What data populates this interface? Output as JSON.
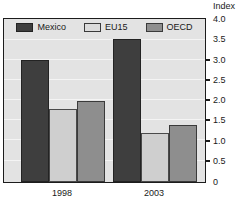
{
  "chart_data": {
    "type": "bar",
    "title": "",
    "subtitle": "",
    "xlabel": "",
    "ylabel": "Index",
    "unit_label": "Index",
    "categories": [
      "1998",
      "2003"
    ],
    "series": [
      {
        "name": "Mexico",
        "values": [
          3.0,
          3.5
        ],
        "color": "#3e3e3e"
      },
      {
        "name": "EU15",
        "values": [
          1.8,
          1.2
        ],
        "color": "#cfcfcf"
      },
      {
        "name": "OECD",
        "values": [
          2.0,
          1.4
        ],
        "color": "#8e8e8e"
      }
    ],
    "ylim": [
      0,
      4.0
    ],
    "ytick_values": [
      0,
      0.5,
      1.0,
      1.5,
      2.0,
      2.5,
      3.0,
      3.5,
      4.0
    ],
    "ytick_labels": [
      "0",
      "0.5",
      "1.0",
      "1.5",
      "2.0",
      "2.5",
      "3.0",
      "3.5",
      "4.0"
    ],
    "grid": true,
    "legend_position": "top-center"
  },
  "legend": {
    "items": [
      {
        "label": "Mexico"
      },
      {
        "label": "EU15"
      },
      {
        "label": "OECD"
      }
    ]
  },
  "axis": {
    "unit": "Index",
    "y_labels": [
      "4.0",
      "3.5",
      "3.0",
      "2.5",
      "2.0",
      "1.5",
      "1.0",
      "0.5",
      "0"
    ],
    "x_labels": [
      "1998",
      "2003"
    ]
  },
  "colors": {
    "mexico": "#3e3e3e",
    "eu15": "#cfcfcf",
    "oecd": "#8e8e8e",
    "plot_background": "#e3e3e3",
    "axis": "#1c1c1c"
  }
}
